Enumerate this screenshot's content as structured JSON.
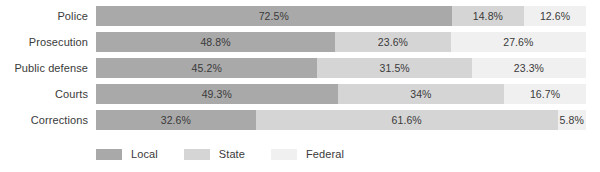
{
  "chart_data": {
    "type": "bar",
    "subtype": "stacked-horizontal-100pct",
    "title": "",
    "subtitle": "",
    "xlabel": "",
    "ylabel": "",
    "xlim": [
      0,
      100
    ],
    "grid": false,
    "legend_position": "bottom-left",
    "categories": [
      "Police",
      "Prosecution",
      "Public defense",
      "Courts",
      "Corrections"
    ],
    "series": [
      {
        "name": "Local",
        "color": "#a9a9a9",
        "values": [
          72.5,
          48.8,
          45.2,
          49.3,
          32.6
        ],
        "labels": [
          "72.5%",
          "48.8%",
          "45.2%",
          "49.3%",
          "32.6%"
        ]
      },
      {
        "name": "State",
        "color": "#d5d5d5",
        "values": [
          14.8,
          23.6,
          31.5,
          34.0,
          61.6
        ],
        "labels": [
          "14.8%",
          "23.6%",
          "31.5%",
          "34%",
          "61.6%"
        ]
      },
      {
        "name": "Federal",
        "color": "#f0f0f0",
        "values": [
          12.6,
          27.6,
          23.3,
          16.7,
          5.8
        ],
        "labels": [
          "12.6%",
          "27.6%",
          "23.3%",
          "16.7%",
          "5.8%"
        ]
      }
    ]
  },
  "rows": [
    {
      "label": "Police",
      "segments": [
        {
          "series": "Local",
          "value": 72.5,
          "label": "72.5%",
          "color": "#a9a9a9"
        },
        {
          "series": "State",
          "value": 14.8,
          "label": "14.8%",
          "color": "#d5d5d5"
        },
        {
          "series": "Federal",
          "value": 12.6,
          "label": "12.6%",
          "color": "#f0f0f0"
        }
      ]
    },
    {
      "label": "Prosecution",
      "segments": [
        {
          "series": "Local",
          "value": 48.8,
          "label": "48.8%",
          "color": "#a9a9a9"
        },
        {
          "series": "State",
          "value": 23.6,
          "label": "23.6%",
          "color": "#d5d5d5"
        },
        {
          "series": "Federal",
          "value": 27.6,
          "label": "27.6%",
          "color": "#f0f0f0"
        }
      ]
    },
    {
      "label": "Public defense",
      "segments": [
        {
          "series": "Local",
          "value": 45.2,
          "label": "45.2%",
          "color": "#a9a9a9"
        },
        {
          "series": "State",
          "value": 31.5,
          "label": "31.5%",
          "color": "#d5d5d5"
        },
        {
          "series": "Federal",
          "value": 23.3,
          "label": "23.3%",
          "color": "#f0f0f0"
        }
      ]
    },
    {
      "label": "Courts",
      "segments": [
        {
          "series": "Local",
          "value": 49.3,
          "label": "49.3%",
          "color": "#a9a9a9"
        },
        {
          "series": "State",
          "value": 34.0,
          "label": "34%",
          "color": "#d5d5d5"
        },
        {
          "series": "Federal",
          "value": 16.7,
          "label": "16.7%",
          "color": "#f0f0f0"
        }
      ]
    },
    {
      "label": "Corrections",
      "segments": [
        {
          "series": "Local",
          "value": 32.6,
          "label": "32.6%",
          "color": "#a9a9a9"
        },
        {
          "series": "State",
          "value": 61.6,
          "label": "61.6%",
          "color": "#d5d5d5"
        },
        {
          "series": "Federal",
          "value": 5.8,
          "label": "5.8%",
          "color": "#f0f0f0"
        }
      ]
    }
  ],
  "legend": {
    "items": [
      {
        "label": "Local",
        "color": "#a9a9a9"
      },
      {
        "label": "State",
        "color": "#d5d5d5"
      },
      {
        "label": "Federal",
        "color": "#f0f0f0"
      }
    ]
  }
}
